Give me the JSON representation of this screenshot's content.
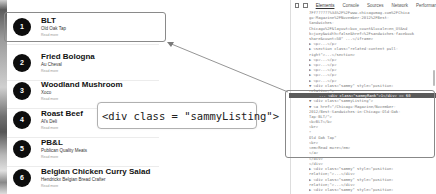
{
  "listing": {
    "items": [
      {
        "number": "1",
        "title": "BLT",
        "place": "Old Oak Tap",
        "read_more": "Read more"
      },
      {
        "number": "2",
        "title": "Fried Bologna",
        "place": "Au Cheval",
        "read_more": "Read more"
      },
      {
        "number": "3",
        "title": "Woodland Mushroom",
        "place": "Xoco",
        "read_more": "Read more"
      },
      {
        "number": "4",
        "title": "Roast Beef",
        "place": "Al's Deli",
        "read_more": "Read more"
      },
      {
        "number": "5",
        "title": "PB&L",
        "place": "Publican Quality Meats",
        "read_more": "Read more"
      },
      {
        "number": "6",
        "title": "Belgian Chicken Curry Salad",
        "place": "Hendrickx Belgian Bread Crafter",
        "read_more": "Read more"
      }
    ]
  },
  "callout": {
    "text": "<div class = \"sammyListing\">"
  },
  "devtools": {
    "tabs": [
      "Elements",
      "Console",
      "Sources",
      "Network",
      "Performar"
    ],
    "active_tab": "Elements",
    "lines": [
      "7Ff??????%3A%2F%2Fwww.chicagomag.com%2FChica",
      "go-Magazine%2FNovember-2012%2FBest-",
      "Sandwiches-",
      "Chicago%2F&layout=box_count&locale=en_US&sd",
      "k=joey&width=false&href=%2Fsandwiches-facebook",
      "share&count=50\" ...</iframe>",
      "▶ <p>...</p>",
      "▶ <section class=\"related-content pull-",
      "right\">...</section>",
      "▶ <p>...</p>",
      "▶ <p>...</p>",
      "▶ <p>...</p>",
      "▶ <p>...</p>",
      "▶ <p>...</p>",
      "▼ <div class=\"sammy\" style=\"position:",
      "relative;\">",
      "... <div class=\"sammyRank\">1</div> == $0",
      "  ▼ <div class=\"sammyListing\">",
      "    ▼ <a href=\"/Chicago-Magazine/November-",
      "    2012/Best-Sandwiches-in-Chicago-Old-Oak-",
      "    Tap-BLT/\">",
      "        <b>BLT</b>",
      "        <br>",
      "        \"",
      "        Old Oak Tap\"",
      "        <br>",
      "        <em>Read more</em>",
      "      </a>",
      "    </div>",
      "  </div>",
      "▶ <div class=\"sammy\" style=\"position:",
      "relative;\">...</div>",
      "▶ <div class=\"sammy\" style=\"position:",
      "relative;\">...</div>",
      "▶ <div class=\"sammy\" style=\"position:"
    ]
  },
  "colors": {
    "badge_bg": "#0d0d0d",
    "selection_bg": "#5a5a5a",
    "outline": "#8a8a8a"
  }
}
